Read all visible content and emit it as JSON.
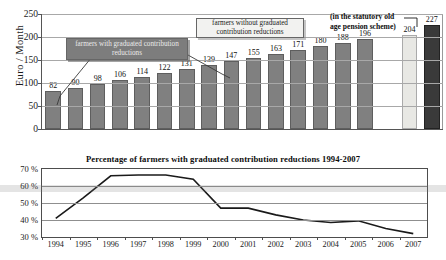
{
  "chart_data": [
    {
      "type": "bar",
      "title": "",
      "xlabel": "",
      "ylabel": "Euro / Month",
      "ylim": [
        0,
        250
      ],
      "yticks": [
        0,
        50,
        100,
        150,
        200,
        250
      ],
      "grid": true,
      "categories": [
        "1",
        "2",
        "3",
        "4",
        "5",
        "6",
        "7",
        "8",
        "9",
        "10",
        "11",
        "12",
        "13",
        "14",
        "15",
        "16",
        "17",
        "18"
      ],
      "values": [
        82,
        90,
        98,
        106,
        114,
        122,
        131,
        139,
        147,
        155,
        163,
        171,
        180,
        188,
        196,
        null,
        204,
        227
      ],
      "bar_styles": [
        "gray",
        "gray",
        "gray",
        "gray",
        "gray",
        "gray",
        "gray",
        "gray",
        "gray",
        "gray",
        "gray",
        "gray",
        "gray",
        "gray",
        "gray",
        "none",
        "light",
        "dark"
      ],
      "annotations": [
        {
          "id": "with-reductions",
          "text": "farmers with graduated contribution reductions",
          "style": "filled"
        },
        {
          "id": "without-reductions",
          "text": "farmers without graduated contribution reductions",
          "style": "open"
        },
        {
          "id": "statutory-scheme",
          "text": "(in the statutory old age  pension scheme)",
          "style": "plain"
        }
      ]
    },
    {
      "type": "line",
      "title": "Percentage of farmers with graduated contribution reductions 1994-2007",
      "xlabel": "",
      "ylabel": "",
      "ylim": [
        30,
        70
      ],
      "yticks": [
        "30 %",
        "40 %",
        "50 %",
        "60 %",
        "70 %"
      ],
      "ytick_values": [
        30,
        40,
        50,
        60,
        70
      ],
      "grid": true,
      "x": [
        "1994",
        "1995",
        "1996",
        "1997",
        "1998",
        "1999",
        "2000",
        "2001",
        "2002",
        "2003",
        "2004",
        "2005",
        "2006",
        "2007"
      ],
      "values": [
        41,
        53,
        66,
        66.5,
        66.5,
        64,
        47,
        47,
        43,
        40,
        38.5,
        39.5,
        35,
        32
      ]
    }
  ],
  "upper": {
    "y_axis_label": "Euro / Month",
    "y_ticks": [
      "250",
      "200",
      "150",
      "100",
      "50"
    ],
    "bar_labels": [
      "82",
      "90",
      "98",
      "106",
      "114",
      "122",
      "131",
      "139",
      "147",
      "155",
      "163",
      "171",
      "180",
      "188",
      "196",
      "204",
      "227"
    ],
    "callout_with": "farmers with graduated contribution reductions",
    "callout_without": "farmers without graduated contribution reductions",
    "callout_statutory_line1": "(in the statutory old",
    "callout_statutory_line2": "age  pension scheme)"
  },
  "lower": {
    "title": "Percentage of farmers with graduated contribution reductions 1994-2007",
    "y_ticks": [
      "70 %",
      "60 %",
      "50 %",
      "40 %",
      "30 %"
    ],
    "x_ticks": [
      "1994",
      "1995",
      "1996",
      "1997",
      "1998",
      "1999",
      "2000",
      "2001",
      "2002",
      "2003",
      "2004",
      "2005",
      "2006",
      "2007"
    ]
  },
  "colors": {
    "bar_gray": "#808080",
    "bar_light": "#e8e8e4",
    "bar_dark": "#3a3a3a",
    "callout_fill": "#7d7d7d",
    "axis": "#4d4d4d"
  }
}
